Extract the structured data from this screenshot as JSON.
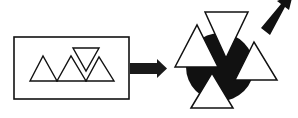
{
  "diagram": {
    "colors": {
      "background": "#ffffff",
      "stroke": "#111111",
      "fill_dark": "#111111",
      "fill_light": "#ffffff",
      "arrow": "#1a1a1a"
    },
    "left_panel": {
      "box": {
        "x": 14,
        "y": 37,
        "w": 115,
        "h": 62
      },
      "triangles": [
        {
          "points": "30,81 43,56 57,81",
          "orientation": "up"
        },
        {
          "points": "57,81 71,56 86,81",
          "orientation": "up"
        },
        {
          "points": "86,81 99,57 114,81",
          "orientation": "up"
        },
        {
          "points": "73,48 99,48 86,71",
          "orientation": "down"
        }
      ]
    },
    "arrow_right": {
      "shaft": {
        "x": 130,
        "y": 63,
        "w": 28,
        "h": 11
      },
      "head": "157,59 167,68.5 157,78"
    },
    "right_panel": {
      "circle": {
        "cx": 220,
        "cy": 67,
        "r": 34
      },
      "triangles": [
        {
          "points": "205,12 248,12 226,58",
          "orientation": "down",
          "name": "top"
        },
        {
          "points": "175,67 197,25 218,67",
          "orientation": "up",
          "name": "left"
        },
        {
          "points": "235,80 254,42 277,80",
          "orientation": "up",
          "name": "right"
        },
        {
          "points": "191,108 212,73 233,108",
          "orientation": "up",
          "name": "bottom"
        }
      ]
    },
    "arrow_diagonal": {
      "points": "261,28 281,4 277,1 293,-6 289,10 285,7 270,35"
    }
  }
}
